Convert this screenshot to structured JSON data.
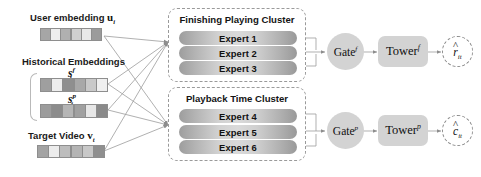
{
  "diagram": {
    "inputs": {
      "user_embedding": {
        "label": "User embedding",
        "symbol": "u",
        "symbol_sub": "i",
        "cells": [
          "#a6a6a6",
          "#eeeeee",
          "#b0b0b0",
          "#cfcfcf",
          "#e8e8e8",
          "#9b9b9b"
        ]
      },
      "historical_group_label": "Historical Embeddings",
      "historical_f": {
        "symbol": "s",
        "symbol_sup": "f",
        "symbol_sub": "i",
        "cells": [
          "#9f9f9f",
          "#ededed",
          "#8f8f8f",
          "#a8a8a8",
          "#c9c9c9",
          "#efefef"
        ]
      },
      "historical_p": {
        "symbol": "s",
        "symbol_sup": "p",
        "symbol_sub": "i",
        "cells": [
          "#9c9c9c",
          "#8c8c8c",
          "#b5b5b5",
          "#a0a0a0",
          "#e7e7e7",
          "#8a8a8a"
        ]
      },
      "target_video": {
        "label": "Target Video",
        "symbol": "v",
        "symbol_sub": "t",
        "cells": [
          "#a3a3a3",
          "#ececec",
          "#bdbdbd",
          "#b4b4b4",
          "#c8c8c8",
          "#8f8f8f"
        ]
      }
    },
    "clusters": [
      {
        "id": "finishing",
        "title": "Finishing Playing Cluster",
        "experts": [
          "Expert 1",
          "Expert 2",
          "Expert 3"
        ]
      },
      {
        "id": "playback",
        "title": "Playback Time Cluster",
        "experts": [
          "Expert 4",
          "Expert 5",
          "Expert 6"
        ]
      }
    ],
    "branches": [
      {
        "id": "finish",
        "gate": {
          "name": "Gate",
          "superscript": "f"
        },
        "tower": {
          "name": "Tower",
          "superscript": "f"
        },
        "output": {
          "symbol": "r",
          "superscript": "",
          "subscript": "it"
        }
      },
      {
        "id": "playtime",
        "gate": {
          "name": "Gate",
          "superscript": "p"
        },
        "tower": {
          "name": "Tower",
          "superscript": "p"
        },
        "output": {
          "symbol": "c",
          "superscript": "",
          "subscript": "it"
        }
      }
    ],
    "colors": {
      "line": "#9a9a9a",
      "dashed_border": "#9a9a9a",
      "node_fill": "#d3d3d3",
      "text": "#111111"
    }
  }
}
